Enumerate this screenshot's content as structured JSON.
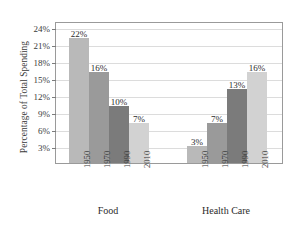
{
  "chart_data": {
    "type": "bar",
    "title": "",
    "xlabel": "",
    "ylabel": "Percentage of Total Spending",
    "ylim": [
      0,
      25
    ],
    "grid": true,
    "legend": "none",
    "ytick_labels": [
      "3%",
      "6%",
      "9%",
      "12%",
      "15%",
      "18%",
      "21%",
      "24%"
    ],
    "ytick_values": [
      3,
      6,
      9,
      12,
      15,
      18,
      21,
      24
    ],
    "groups": [
      "Food",
      "Health Care"
    ],
    "categories": [
      "1950",
      "1970",
      "1990",
      "2010"
    ],
    "series": [
      {
        "name": "Food",
        "values": [
          22,
          16,
          10,
          7
        ],
        "labels": [
          "22%",
          "16%",
          "10%",
          "7%"
        ]
      },
      {
        "name": "Health Care",
        "values": [
          3,
          7,
          13,
          16
        ],
        "labels": [
          "3%",
          "7%",
          "13%",
          "16%"
        ]
      }
    ],
    "bar_colors": [
      "#b9b9b9",
      "#9a9a9a",
      "#7b7b7b",
      "#d2d2d2"
    ],
    "colors": {
      "background": "#ffffff",
      "frame": "#9a9a9a",
      "grid": "#dcdcdc",
      "text": "#2b2b2b"
    }
  }
}
